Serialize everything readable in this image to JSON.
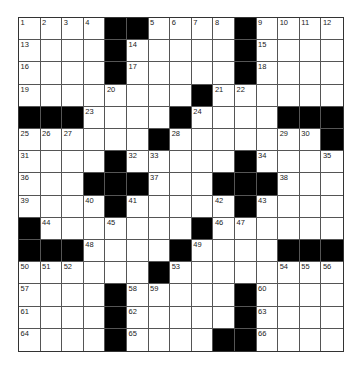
{
  "puzzle": {
    "type": "crossword",
    "rows": 15,
    "cols": 15,
    "colors": {
      "black": "#000000",
      "white": "#ffffff",
      "line": "#555555"
    },
    "grid": [
      [
        "1",
        "2",
        "3",
        "4",
        "#",
        "#",
        "5",
        "6",
        "7",
        "8",
        "#",
        "9",
        "10",
        "11",
        "12"
      ],
      [
        "13",
        "",
        "",
        "",
        "#",
        "14",
        "",
        "",
        "",
        "",
        "#",
        "15",
        "",
        "",
        ""
      ],
      [
        "16",
        "",
        "",
        "",
        "#",
        "17",
        "",
        "",
        "",
        "",
        "#",
        "18",
        "",
        "",
        ""
      ],
      [
        "19",
        "",
        "",
        "",
        "20",
        "",
        "",
        "",
        "#",
        "21",
        "22",
        "",
        "",
        "",
        ""
      ],
      [
        "#",
        "#",
        "#",
        "23",
        "",
        "",
        "",
        "#",
        "24",
        "",
        "",
        "",
        "#",
        "#",
        "#"
      ],
      [
        "25",
        "26",
        "27",
        "",
        "",
        "",
        "#",
        "28",
        "",
        "",
        "",
        "",
        "29",
        "30",
        "#"
      ],
      [
        "31",
        "",
        "",
        "",
        "#",
        "32",
        "33",
        "",
        "",
        "",
        "#",
        "34",
        "",
        "",
        "35"
      ],
      [
        "36",
        "",
        "",
        "#",
        "#",
        "#",
        "37",
        "",
        "",
        "#",
        "#",
        "#",
        "38",
        "",
        ""
      ],
      [
        "39",
        "",
        "",
        "40",
        "#",
        "41",
        "",
        "",
        "",
        "42",
        "#",
        "43",
        "",
        "",
        ""
      ],
      [
        "#",
        "44",
        "",
        "",
        "45",
        "",
        "",
        "",
        "#",
        "46",
        "47",
        "",
        "",
        "",
        ""
      ],
      [
        "#",
        "#",
        "#",
        "48",
        "",
        "",
        "",
        "#",
        "49",
        "",
        "",
        "",
        "#",
        "#",
        "#"
      ],
      [
        "50",
        "51",
        "52",
        "",
        "",
        "",
        "#",
        "53",
        "",
        "",
        "",
        "",
        "54",
        "55",
        "56"
      ],
      [
        "57",
        "",
        "",
        "",
        "#",
        "58",
        "59",
        "",
        "",
        "",
        "#",
        "60",
        "",
        "",
        ""
      ],
      [
        "61",
        "",
        "",
        "",
        "#",
        "62",
        "",
        "",
        "",
        "",
        "#",
        "63",
        "",
        "",
        ""
      ],
      [
        "64",
        "",
        "",
        "",
        "#",
        "65",
        "",
        "",
        "",
        "#",
        "#",
        "66",
        "",
        "",
        ""
      ]
    ]
  }
}
